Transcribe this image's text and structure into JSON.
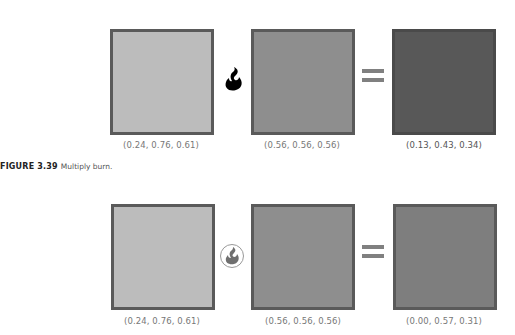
{
  "figures": [
    {
      "operator": "multiply-burn-icon",
      "swatches": [
        {
          "label": "(0.24, 0.76, 0.61)",
          "color": "#bcbcbc"
        },
        {
          "label": "(0.56, 0.56, 0.56)",
          "color": "#8e8e8e"
        },
        {
          "label": "(0.13, 0.43, 0.34)",
          "color": "#585858"
        }
      ]
    },
    {
      "operator": "color-burn-icon",
      "swatches": [
        {
          "label": "(0.24, 0.76, 0.61)",
          "color": "#bcbcbc"
        },
        {
          "label": "(0.56, 0.56, 0.56)",
          "color": "#8e8e8e"
        },
        {
          "label": "(0.00, 0.57, 0.31)",
          "color": "#7e7e7e"
        }
      ]
    }
  ],
  "caption": {
    "number": "FIGURE 3.39",
    "text": "Multiply burn."
  }
}
